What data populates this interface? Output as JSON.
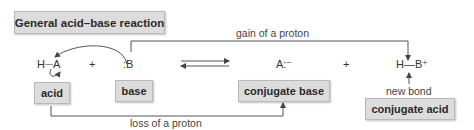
{
  "title": "General acid–base reaction",
  "equation": {
    "reactant1": {
      "H": "H",
      "bond": "—",
      "A": "A"
    },
    "plus1": "+",
    "reactant2": ":B",
    "equilibrium_arrow": "⇄",
    "product1": "A:⁻",
    "plus2": "+",
    "product2": "H—B⁺"
  },
  "labels": {
    "acid": "acid",
    "base": "base",
    "conjugate_base": "conjugate base",
    "conjugate_acid": "conjugate acid"
  },
  "annotations": {
    "gain": "gain of a proton",
    "loss": "loss of a proton",
    "new_bond": "new bond"
  },
  "colors": {
    "box_fill": "#dcdcdc",
    "box_border": "#b9b9b9",
    "line": "#555555"
  }
}
